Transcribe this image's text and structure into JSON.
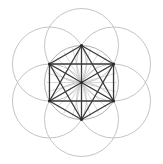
{
  "figure": {
    "colors": {
      "background": "#ffffff",
      "outer_circles": "#c4c4c4",
      "inner_circle": "#b0b0b0",
      "edges": "#3a3a3a",
      "vertices": "#2a2a2a",
      "spokes": "#bdbdbd"
    },
    "outer_circle_count": 6,
    "hexagon_vertex_count": 6,
    "center_vertex": true,
    "spoke_count": 12
  }
}
